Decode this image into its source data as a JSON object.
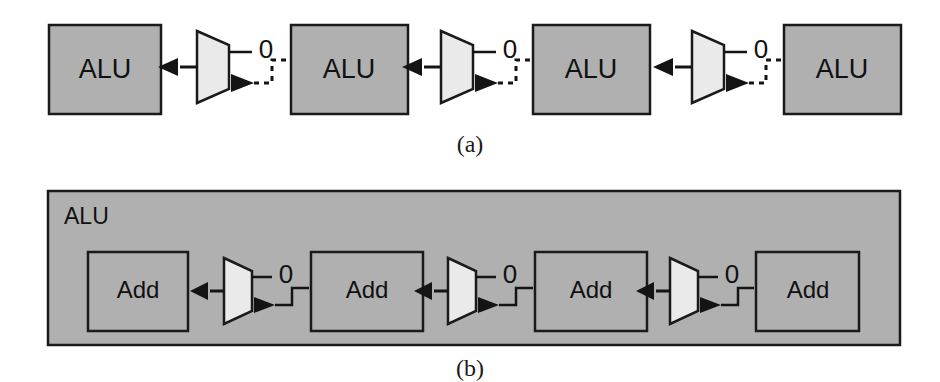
{
  "figure": {
    "background": "#ffffff",
    "colors": {
      "block_fill": "#b0b0b0",
      "block_stroke": "#1a1a1a",
      "mux_fill": "#eaeaea",
      "mux_stroke": "#1a1a1a",
      "wire": "#141414",
      "text": "#111111"
    }
  },
  "panel_a": {
    "caption": "(a)",
    "line_style": "dotted",
    "blocks": [
      {
        "label": "ALU",
        "x": 49,
        "y": 25,
        "w": 112,
        "h": 89
      },
      {
        "label": "ALU",
        "x": 291,
        "y": 25,
        "w": 117,
        "h": 89
      },
      {
        "label": "ALU",
        "x": 533,
        "y": 25,
        "w": 117,
        "h": 89
      },
      {
        "label": "ALU",
        "x": 784,
        "y": 25,
        "w": 117,
        "h": 89
      }
    ],
    "muxes": [
      {
        "x": 197,
        "y": 31,
        "w": 32,
        "h": 72,
        "select_label": "0"
      },
      {
        "x": 441,
        "y": 31,
        "w": 32,
        "h": 72,
        "select_label": "0"
      },
      {
        "x": 692,
        "y": 31,
        "w": 32,
        "h": 72,
        "select_label": "0"
      }
    ]
  },
  "panel_b": {
    "caption": "(b)",
    "line_style": "solid",
    "container": {
      "label": "ALU",
      "x": 48,
      "y": 191,
      "w": 852,
      "h": 154
    },
    "blocks": [
      {
        "label": "Add",
        "x": 88,
        "y": 252,
        "w": 100,
        "h": 79
      },
      {
        "label": "Add",
        "x": 311,
        "y": 252,
        "w": 112,
        "h": 79
      },
      {
        "label": "Add",
        "x": 535,
        "y": 252,
        "w": 112,
        "h": 79
      },
      {
        "label": "Add",
        "x": 756,
        "y": 252,
        "w": 103,
        "h": 79
      }
    ],
    "muxes": [
      {
        "x": 224,
        "y": 258,
        "w": 28,
        "h": 66,
        "select_label": "0"
      },
      {
        "x": 448,
        "y": 258,
        "w": 28,
        "h": 66,
        "select_label": "0"
      },
      {
        "x": 670,
        "y": 258,
        "w": 28,
        "h": 66,
        "select_label": "0"
      }
    ]
  }
}
